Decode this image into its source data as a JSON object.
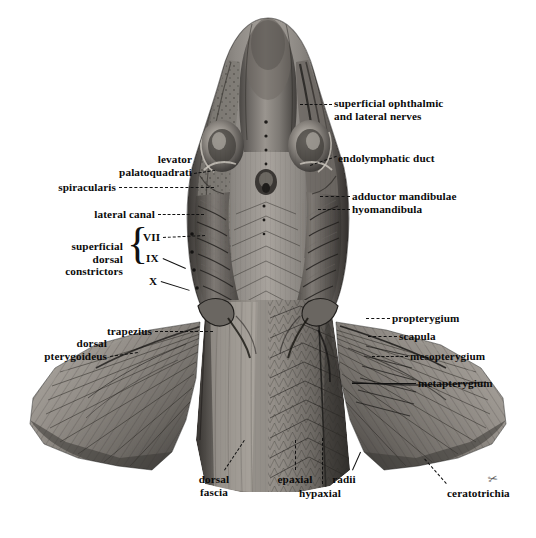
{
  "plate": {
    "title": "Dorsal dissection of elasmobranch head and pectoral fins",
    "background_color": "#ffffff",
    "ink_color": "#111111",
    "signature": "✂"
  },
  "labels": [
    {
      "id": "superficial-ophthalmic",
      "text": "superficial ophthalmic\nand lateral nerves",
      "align": "left",
      "x": 334,
      "y": 97,
      "leader": {
        "x1": 300,
        "y1": 104,
        "x2": 332,
        "y2": 104,
        "style": "dashed"
      }
    },
    {
      "id": "endolymphatic-duct",
      "text": "endolymphatic duct",
      "align": "left",
      "x": 338,
      "y": 152,
      "leader": {
        "x1": 310,
        "y1": 165,
        "x2": 336,
        "y2": 156,
        "style": "dashed"
      }
    },
    {
      "id": "levator-palatoquadrati",
      "text": "levator\npalatoquadrati",
      "align": "right",
      "x": 192,
      "y": 153,
      "leader": {
        "x1": 194,
        "y1": 173,
        "x2": 215,
        "y2": 170,
        "style": "dashed"
      }
    },
    {
      "id": "spiracularis",
      "text": "spiracularis",
      "align": "right",
      "x": 116,
      "y": 181,
      "leader": {
        "x1": 119,
        "y1": 187,
        "x2": 214,
        "y2": 187,
        "style": "dashed"
      }
    },
    {
      "id": "adductor-mandibulae",
      "text": "adductor mandibulae",
      "align": "left",
      "x": 352,
      "y": 190,
      "leader": {
        "x1": 320,
        "y1": 196,
        "x2": 350,
        "y2": 196,
        "style": "dashed"
      }
    },
    {
      "id": "hyomandibula",
      "text": "hyomandibula",
      "align": "left",
      "x": 352,
      "y": 203,
      "leader": {
        "x1": 318,
        "y1": 209,
        "x2": 350,
        "y2": 209,
        "style": "dashed"
      }
    },
    {
      "id": "lateral-canal",
      "text": "lateral canal",
      "align": "right",
      "x": 155,
      "y": 208,
      "leader": {
        "x1": 158,
        "y1": 214,
        "x2": 204,
        "y2": 214,
        "style": "dashed"
      }
    },
    {
      "id": "superficial-dorsal-constrictors",
      "text": "superficial\ndorsal\nconstrictors",
      "align": "right",
      "x": 123,
      "y": 240,
      "leader": null
    },
    {
      "id": "nerve-vii",
      "text": "VII",
      "align": "left",
      "x": 143,
      "y": 231,
      "leader": {
        "x1": 163,
        "y1": 237,
        "x2": 205,
        "y2": 235,
        "style": "dashed"
      }
    },
    {
      "id": "nerve-ix",
      "text": "IX",
      "align": "left",
      "x": 146,
      "y": 252,
      "leader": {
        "x1": 163,
        "y1": 258,
        "x2": 186,
        "y2": 268,
        "style": "solid"
      }
    },
    {
      "id": "nerve-x",
      "text": "X",
      "align": "left",
      "x": 149,
      "y": 275,
      "leader": {
        "x1": 161,
        "y1": 281,
        "x2": 190,
        "y2": 290,
        "style": "solid"
      }
    },
    {
      "id": "trapezius",
      "text": "trapezius",
      "align": "right",
      "x": 152,
      "y": 325,
      "leader": {
        "x1": 155,
        "y1": 331,
        "x2": 213,
        "y2": 331,
        "style": "dashed"
      }
    },
    {
      "id": "dorsal-pterygoideus",
      "text": "dorsal\npterygoideus",
      "align": "right",
      "x": 107,
      "y": 337,
      "leader": {
        "x1": 110,
        "y1": 356,
        "x2": 138,
        "y2": 352,
        "style": "dashed"
      }
    },
    {
      "id": "propterygium",
      "text": "propterygium",
      "align": "left",
      "x": 392,
      "y": 312,
      "leader": {
        "x1": 366,
        "y1": 318,
        "x2": 390,
        "y2": 318,
        "style": "dashed"
      }
    },
    {
      "id": "scapula",
      "text": "scapula",
      "align": "left",
      "x": 399,
      "y": 330,
      "leader": {
        "x1": 368,
        "y1": 336,
        "x2": 397,
        "y2": 336,
        "style": "dashed"
      }
    },
    {
      "id": "mesopterygium",
      "text": "mesopterygium",
      "align": "left",
      "x": 410,
      "y": 350,
      "leader": {
        "x1": 372,
        "y1": 356,
        "x2": 408,
        "y2": 356,
        "style": "dashed"
      }
    },
    {
      "id": "metapterygium",
      "text": "metapterygium",
      "align": "left",
      "x": 418,
      "y": 377,
      "leader": {
        "x1": 352,
        "y1": 383,
        "x2": 416,
        "y2": 383,
        "style": "solid"
      }
    },
    {
      "id": "dorsal-fascia",
      "text": "dorsal\nfascia",
      "align": "center",
      "x": 214,
      "y": 473,
      "leader": {
        "x1": 224,
        "y1": 470,
        "x2": 244,
        "y2": 440,
        "style": "dashed"
      }
    },
    {
      "id": "epaxial",
      "text": "epaxial",
      "align": "center",
      "x": 295,
      "y": 473,
      "leader": {
        "x1": 295,
        "y1": 470,
        "x2": 295,
        "y2": 440,
        "style": "dashed"
      }
    },
    {
      "id": "hypaxial",
      "text": "hypaxial",
      "align": "center",
      "x": 320,
      "y": 487,
      "leader": {
        "x1": 322,
        "y1": 484,
        "x2": 322,
        "y2": 438,
        "style": "dashed"
      }
    },
    {
      "id": "radii",
      "text": "radii",
      "align": "center",
      "x": 344,
      "y": 473,
      "leader": {
        "x1": 352,
        "y1": 470,
        "x2": 360,
        "y2": 452,
        "style": "solid"
      }
    },
    {
      "id": "ceratotrichia",
      "text": "ceratotrichia",
      "align": "left",
      "x": 447,
      "y": 487,
      "leader": {
        "x1": 446,
        "y1": 484,
        "x2": 424,
        "y2": 459,
        "style": "dashed"
      }
    }
  ],
  "brace": {
    "symbol": "{",
    "x": 127,
    "y": 222
  },
  "signature": {
    "x": 488,
    "y": 478
  }
}
